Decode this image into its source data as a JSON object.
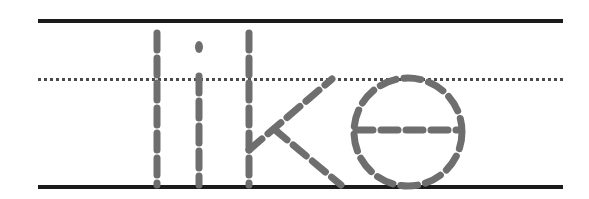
{
  "worksheet": {
    "type": "handwriting-tracing-worksheet",
    "word": "like",
    "letters": [
      "l",
      "i",
      "k",
      "e"
    ],
    "case": "lowercase",
    "script": "print-manuscript",
    "background_color": "#ffffff"
  },
  "guide_lines": {
    "top_line": {
      "name": "top-solid-line",
      "style": "solid",
      "color": "#1b1b1b",
      "thickness_px": 4,
      "y": 19,
      "x_start": 38,
      "x_end": 563
    },
    "midline": {
      "name": "dotted-midline",
      "style": "dotted",
      "color": "#4a4a4a",
      "thickness_px": 3,
      "y": 78,
      "x_start": 38,
      "x_end": 563
    },
    "baseline": {
      "name": "bottom-solid-line",
      "style": "solid",
      "color": "#1b1b1b",
      "thickness_px": 4,
      "y": 185,
      "x_start": 38,
      "x_end": 563
    }
  },
  "trace_letters": {
    "stroke_color": "#6e6e6e",
    "stroke_width": 7,
    "dash_pattern": "17 8",
    "glyphs": [
      {
        "letter": "l",
        "name": "letter-l",
        "strokes": [
          {
            "name": "l-stem",
            "type": "line",
            "x1": 157,
            "y1": 33,
            "x2": 157,
            "y2": 185
          }
        ]
      },
      {
        "letter": "i",
        "name": "letter-i",
        "strokes": [
          {
            "name": "i-tittle",
            "type": "dot",
            "cx": 199,
            "cy": 47,
            "rx": 4,
            "ry": 6
          },
          {
            "name": "i-stem",
            "type": "line",
            "x1": 199,
            "y1": 76,
            "x2": 199,
            "y2": 185
          }
        ]
      },
      {
        "letter": "k",
        "name": "letter-k",
        "strokes": [
          {
            "name": "k-stem",
            "type": "line",
            "x1": 249,
            "y1": 33,
            "x2": 249,
            "y2": 185
          },
          {
            "name": "k-upper-arm",
            "type": "line",
            "x1": 249,
            "y1": 150,
            "x2": 332,
            "y2": 79
          },
          {
            "name": "k-lower-leg",
            "type": "line",
            "x1": 274,
            "y1": 129,
            "x2": 341,
            "y2": 185
          }
        ]
      },
      {
        "letter": "e",
        "name": "letter-e",
        "strokes": [
          {
            "name": "e-bowl",
            "type": "circle",
            "cx": 408,
            "cy": 132,
            "r": 54
          },
          {
            "name": "e-crossbar",
            "type": "line",
            "x1": 356,
            "y1": 130,
            "x2": 458,
            "y2": 130
          }
        ]
      }
    ]
  }
}
